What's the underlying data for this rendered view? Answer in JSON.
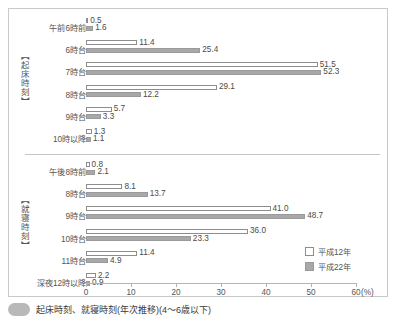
{
  "chart_data": {
    "type": "bar",
    "orientation": "horizontal",
    "title": "",
    "xlabel": "(%)",
    "ylabel": "",
    "xlim": [
      0,
      60
    ],
    "xticks": [
      0,
      10,
      20,
      30,
      40,
      50,
      60
    ],
    "xticklabels": [
      "0",
      "10",
      "20",
      "30",
      "40",
      "50",
      "60"
    ],
    "unit": "(%)",
    "grid": false,
    "legend_position": "right-middle",
    "legend": [
      "平成12年",
      "平成22年"
    ],
    "sections": [
      {
        "label": "【起床時刻】",
        "categories": [
          "午前6時前",
          "6時台",
          "7時台",
          "8時台",
          "9時台",
          "10時以降"
        ],
        "series": [
          {
            "name": "平成12年",
            "values": [
              0.5,
              11.4,
              51.5,
              29.1,
              5.7,
              1.3
            ]
          },
          {
            "name": "平成22年",
            "values": [
              1.6,
              25.4,
              52.3,
              12.2,
              3.3,
              1.1
            ]
          }
        ]
      },
      {
        "label": "【就寝時刻】",
        "categories": [
          "午後8時前",
          "8時台",
          "9時台",
          "10時台",
          "11時台",
          "深夜12時以降"
        ],
        "series": [
          {
            "name": "平成12年",
            "values": [
              0.8,
              8.1,
              41.0,
              36.0,
              11.4,
              2.2
            ]
          },
          {
            "name": "平成22年",
            "values": [
              2.1,
              13.7,
              48.7,
              23.3,
              4.9,
              0.9
            ]
          }
        ]
      }
    ]
  },
  "colors": {
    "series_12": "#ffffff",
    "series_22": "#a8a8a8",
    "border": "#c9c9c9",
    "axis": "#b4b4b4",
    "text": "#4a4a4a"
  },
  "caption": {
    "text": "起床時刻、就寝時刻(年次推移)(4～6歳以下)"
  }
}
